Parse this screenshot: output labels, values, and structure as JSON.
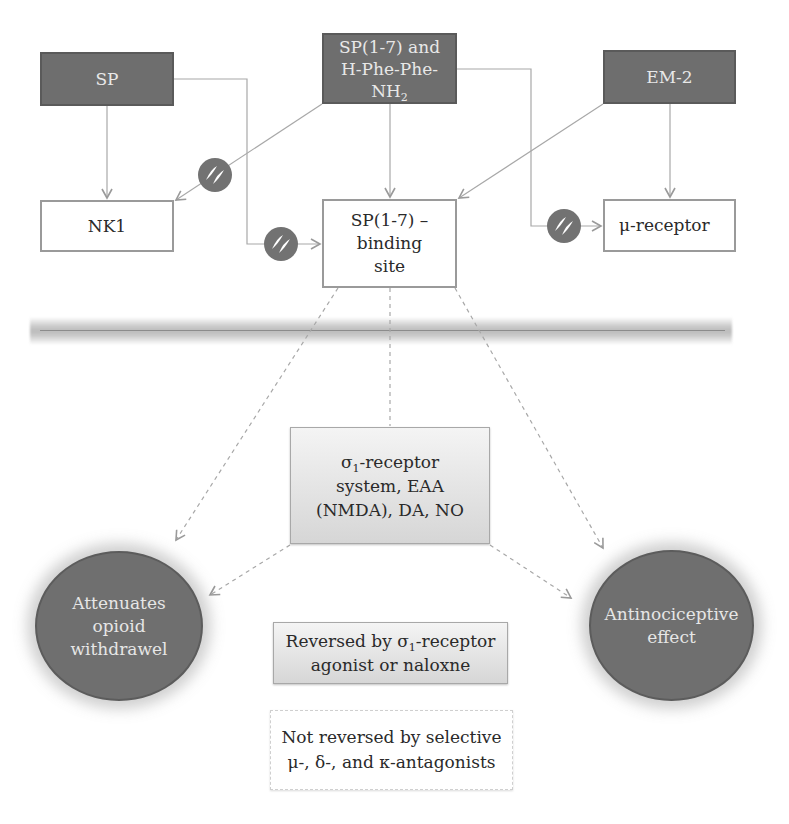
{
  "diagram": {
    "top_nodes": {
      "sp": {
        "label": "SP"
      },
      "sp17_phe": {
        "line1": "SP(1-7) and",
        "line2": "H-Phe-Phe-",
        "line3_main": "NH",
        "line3_sub": "2"
      },
      "em2": {
        "label": "EM-2"
      }
    },
    "receptor_nodes": {
      "nk1": {
        "label": "NK1"
      },
      "binding_site": {
        "line1": "SP(1-7) –",
        "line2": "binding",
        "line3": "site"
      },
      "mu_receptor": {
        "label": "μ-receptor"
      }
    },
    "mediator_box": {
      "line1_main": "σ",
      "line1_sub": "1",
      "line1_rest": "-receptor",
      "line2": "system, EAA",
      "line3": "(NMDA), DA, NO"
    },
    "effects": {
      "left": {
        "line1": "Attenuates",
        "line2": "opioid",
        "line3": "withdrawel"
      },
      "right": {
        "line1": "Antinociceptive",
        "line2": "effect"
      }
    },
    "notes": {
      "reversed": {
        "line1_pre": "Reversed by σ",
        "line1_sub": "1",
        "line1_post": "-receptor",
        "line2": "agonist or naloxne"
      },
      "not_reversed": {
        "line1": "Not reversed by selective",
        "line2": "μ-, δ-, and κ-antagonists"
      }
    },
    "edges": [
      {
        "from": "SP",
        "to": "NK1",
        "type": "activates"
      },
      {
        "from": "SP",
        "to": "SP(1-7) binding site",
        "type": "blocked"
      },
      {
        "from": "SP(1-7) and H-Phe-Phe-NH2",
        "to": "NK1",
        "type": "blocked"
      },
      {
        "from": "SP(1-7) and H-Phe-Phe-NH2",
        "to": "SP(1-7) binding site",
        "type": "activates"
      },
      {
        "from": "SP(1-7) and H-Phe-Phe-NH2",
        "to": "μ-receptor",
        "type": "blocked"
      },
      {
        "from": "EM-2",
        "to": "SP(1-7) binding site",
        "type": "activates"
      },
      {
        "from": "EM-2",
        "to": "μ-receptor",
        "type": "activates"
      },
      {
        "from": "SP(1-7) binding site",
        "to": "σ1-receptor system",
        "type": "dashed"
      },
      {
        "from": "SP(1-7) binding site",
        "to": "Attenuates opioid withdrawel",
        "type": "dashed"
      },
      {
        "from": "SP(1-7) binding site",
        "to": "Antinociceptive effect",
        "type": "dashed"
      },
      {
        "from": "σ1-receptor system",
        "to": "Attenuates opioid withdrawel",
        "type": "dashed"
      },
      {
        "from": "σ1-receptor system",
        "to": "Antinociceptive effect",
        "type": "dashed"
      }
    ],
    "colors": {
      "dark_node": "#6e6e6e",
      "line": "#9a9a9a",
      "inhibit_symbol": "#707070",
      "membrane": "#bdbdbd"
    }
  }
}
